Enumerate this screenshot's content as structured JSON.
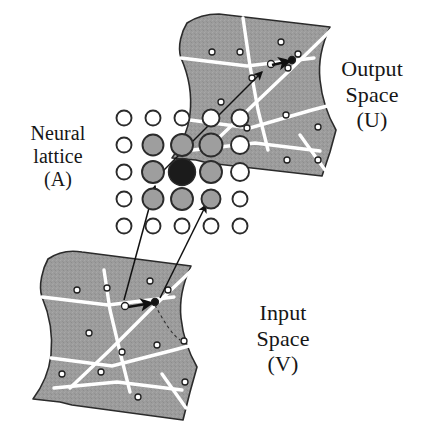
{
  "figure": {
    "background_color": "#ffffff",
    "width": 425,
    "height": 437
  },
  "labels": {
    "neural_lattice": {
      "line1": "Neural",
      "line2": "lattice",
      "line3": "(A)",
      "symbol": "A",
      "full_text": "Neural lattice (A)"
    },
    "output_space": {
      "line1": "Output",
      "line2": "Space",
      "line3": "(U)",
      "symbol": "U",
      "full_text": "Output Space (U)"
    },
    "input_space": {
      "line1": "Input",
      "line2": "Space",
      "line3": "(V)",
      "symbol": "V",
      "full_text": "Input Space (V)"
    }
  },
  "colors": {
    "manifold_fill": "#9c9c9c",
    "manifold_stroke": "#2b2b2b",
    "partition_line": "#ffffff",
    "node_gray_fill": "#9e9e9e",
    "node_open_fill": "#ffffff",
    "node_active_fill": "#1b1b1b",
    "node_stroke": "#2b2b2b",
    "arrow_color": "#111111",
    "text_color": "#161616"
  },
  "neural_lattice": {
    "rows": 5,
    "cols": 5,
    "origin_x": 124,
    "origin_y": 118,
    "step_x": 29,
    "step_y": 27,
    "nodes": [
      {
        "row": 1,
        "col": 1,
        "state": "open",
        "radius": 7.5
      },
      {
        "row": 1,
        "col": 2,
        "state": "open",
        "radius": 7.5
      },
      {
        "row": 1,
        "col": 3,
        "state": "open",
        "radius": 7.5
      },
      {
        "row": 1,
        "col": 4,
        "state": "open",
        "radius": 8.5
      },
      {
        "row": 1,
        "col": 5,
        "state": "open",
        "radius": 8.5
      },
      {
        "row": 2,
        "col": 1,
        "state": "open",
        "radius": 7.5
      },
      {
        "row": 2,
        "col": 2,
        "state": "gray",
        "radius": 10.5
      },
      {
        "row": 2,
        "col": 3,
        "state": "gray",
        "radius": 11.0
      },
      {
        "row": 2,
        "col": 4,
        "state": "gray",
        "radius": 11.5
      },
      {
        "row": 2,
        "col": 5,
        "state": "open",
        "radius": 9.0
      },
      {
        "row": 3,
        "col": 1,
        "state": "open",
        "radius": 7.5
      },
      {
        "row": 3,
        "col": 2,
        "state": "gray",
        "radius": 11.0
      },
      {
        "row": 3,
        "col": 3,
        "state": "active",
        "radius": 13.5
      },
      {
        "row": 3,
        "col": 4,
        "state": "gray",
        "radius": 11.0
      },
      {
        "row": 3,
        "col": 5,
        "state": "open",
        "radius": 9.0
      },
      {
        "row": 4,
        "col": 1,
        "state": "open",
        "radius": 7.5
      },
      {
        "row": 4,
        "col": 2,
        "state": "gray",
        "radius": 10.5
      },
      {
        "row": 4,
        "col": 3,
        "state": "gray",
        "radius": 11.0
      },
      {
        "row": 4,
        "col": 4,
        "state": "gray",
        "radius": 9.5
      },
      {
        "row": 4,
        "col": 5,
        "state": "open",
        "radius": 7.5
      },
      {
        "row": 5,
        "col": 1,
        "state": "open",
        "radius": 7.5
      },
      {
        "row": 5,
        "col": 2,
        "state": "open",
        "radius": 7.5
      },
      {
        "row": 5,
        "col": 3,
        "state": "open",
        "radius": 7.5
      },
      {
        "row": 5,
        "col": 4,
        "state": "open",
        "radius": 7.5
      },
      {
        "row": 5,
        "col": 5,
        "state": "open",
        "radius": 7.5
      }
    ],
    "winner_node": {
      "row": 3,
      "col": 3,
      "description": "best-matching unit (filled black)"
    },
    "neighborhood_nodes_count": 8
  },
  "output_manifold": {
    "name": "Output Space (U)",
    "outline": "M 187,23 C 196,17 207,14 219,14 L 330,27 C 322,44 318,62 320,80 C 322,100 328,116 336,130 L 330,152 L 322,176 L 208,163 L 196,160 L 172,158 C 181,146 188,131 190,114 C 192,96 189,76 181,58 C 177,46 182,31 187,23 Z",
    "partition_lines": [
      "M 181,58 L 247,66 L 314,58",
      "M 243,18 L 250,66 L 258,110 L 268,150",
      "M 331,30 L 290,70 L 248,110 L 208,148",
      "M 190,120 L 250,128 L 312,110 L 335,104",
      "M 193,150 L 255,143 L 320,151",
      "M 300,135 L 325,170"
    ],
    "dots": [
      {
        "x": 212,
        "y": 52,
        "r": 3.0,
        "kind": "open"
      },
      {
        "x": 240,
        "y": 52,
        "r": 3.0,
        "kind": "open"
      },
      {
        "x": 281,
        "y": 42,
        "r": 3.0,
        "kind": "open"
      },
      {
        "x": 298,
        "y": 54,
        "r": 3.0,
        "kind": "open"
      },
      {
        "x": 221,
        "y": 102,
        "r": 3.0,
        "kind": "open"
      },
      {
        "x": 252,
        "y": 78,
        "r": 3.0,
        "kind": "open"
      },
      {
        "x": 247,
        "y": 128,
        "r": 3.0,
        "kind": "open"
      },
      {
        "x": 288,
        "y": 68,
        "r": 3.0,
        "kind": "open"
      },
      {
        "x": 286,
        "y": 115,
        "r": 3.0,
        "kind": "open"
      },
      {
        "x": 287,
        "y": 160,
        "r": 3.0,
        "kind": "open"
      },
      {
        "x": 318,
        "y": 160,
        "r": 3.0,
        "kind": "open"
      },
      {
        "x": 318,
        "y": 127,
        "r": 3.0,
        "kind": "open"
      },
      {
        "x": 271,
        "y": 64,
        "r": 3.5,
        "kind": "open"
      },
      {
        "x": 292,
        "y": 60,
        "r": 3.5,
        "kind": "filled"
      }
    ],
    "local_arrow": {
      "from_x": 272,
      "from_y": 65,
      "to_x": 290,
      "to_y": 61,
      "description": "local displacement vector in output space"
    }
  },
  "input_manifold": {
    "name": "Input Space (V)",
    "outline": "M 48,259 C 58,252 70,250 82,252 L 191,266 C 183,283 179,300 181,318 C 183,337 189,353 197,367 L 190,392 L 183,420 L 72,405 L 60,402 L 33,399 C 42,387 49,372 51,355 C 53,336 50,316 42,297 C 38,285 43,268 48,259 Z",
    "partition_lines": [
      "M 42,297 L 108,305 L 174,297",
      "M 104,270 L 110,310 L 120,352 L 130,392",
      "M 192,270 L 150,310 L 110,350 L 70,388",
      "M 51,358 L 112,366 L 174,350 L 196,344",
      "M 54,388 L 117,382 L 182,390",
      "M 162,374 L 186,408"
    ],
    "dots": [
      {
        "x": 77,
        "y": 290,
        "r": 3.0,
        "kind": "open"
      },
      {
        "x": 107,
        "y": 288,
        "r": 3.0,
        "kind": "open"
      },
      {
        "x": 150,
        "y": 281,
        "r": 3.0,
        "kind": "open"
      },
      {
        "x": 168,
        "y": 290,
        "r": 3.0,
        "kind": "open"
      },
      {
        "x": 89,
        "y": 333,
        "r": 3.0,
        "kind": "open"
      },
      {
        "x": 122,
        "y": 352,
        "r": 3.0,
        "kind": "open"
      },
      {
        "x": 62,
        "y": 374,
        "r": 3.0,
        "kind": "open"
      },
      {
        "x": 101,
        "y": 372,
        "r": 3.0,
        "kind": "open"
      },
      {
        "x": 138,
        "y": 397,
        "r": 3.0,
        "kind": "open"
      },
      {
        "x": 157,
        "y": 345,
        "r": 3.0,
        "kind": "open"
      },
      {
        "x": 185,
        "y": 382,
        "r": 3.0,
        "kind": "open"
      },
      {
        "x": 184,
        "y": 341,
        "r": 3.0,
        "kind": "open"
      },
      {
        "x": 125,
        "y": 306,
        "r": 3.5,
        "kind": "open"
      },
      {
        "x": 155,
        "y": 302,
        "r": 3.5,
        "kind": "filled"
      }
    ],
    "local_arrow": {
      "from_x": 128,
      "from_y": 307,
      "to_x": 152,
      "to_y": 303,
      "description": "local displacement vector in input space"
    },
    "dashed_connector": "M 155,305 C 163,320 172,335 180,340"
  },
  "mapping_arrows": [
    {
      "name": "lattice-to-output",
      "from_x": 156,
      "from_y": 178,
      "to_x": 262,
      "to_y": 72,
      "description": "arrow from winning lattice node into output space"
    },
    {
      "name": "input-to-lattice-winner",
      "from_x": 124,
      "from_y": 300,
      "to_x": 155,
      "to_y": 186,
      "description": "arrow from input space to the winning lattice node"
    },
    {
      "name": "input-to-lattice-neighbor",
      "from_x": 160,
      "from_y": 298,
      "to_x": 206,
      "to_y": 205,
      "description": "arrow from input space to a neighboring lattice node"
    }
  ]
}
